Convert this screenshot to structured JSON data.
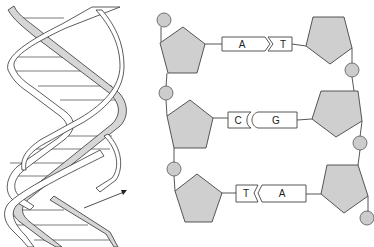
{
  "figure": {
    "colors": {
      "sugar_fill": "#cfcfcf",
      "phosphate_fill": "#cccccc",
      "stroke": "#333333",
      "ribbon_fill": "#ffffff",
      "ribbon_shade": "#d6d6d6",
      "background": "#ffffff"
    }
  },
  "helix": {
    "label": "double-helix",
    "arrow": "pointer-arrow"
  },
  "base_pairs": [
    {
      "left": "A",
      "right": "T"
    },
    {
      "left": "C",
      "right": "G"
    },
    {
      "left": "T",
      "right": "A"
    }
  ]
}
